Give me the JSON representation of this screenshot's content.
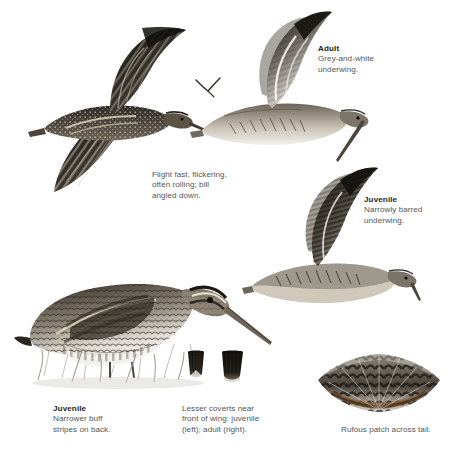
{
  "plate": {
    "background": "#ffffff",
    "ink": "#1d1f22",
    "caption_color": "#53565b",
    "width": 459,
    "height": 454
  },
  "figures": [
    {
      "name": "snipe-flight-upperside",
      "role": "Snipe in flight seen from above, wings raised in a V, dark brown back with buff braces, bill angled down",
      "position": {
        "x": 22,
        "y": 22,
        "w": 185,
        "h": 190
      }
    },
    {
      "name": "snipe-flight-adult-underwing",
      "role": "Adult snipe in flight seen from below showing grey-and-white underwing",
      "position": {
        "x": 196,
        "y": 18,
        "w": 170,
        "h": 145
      }
    },
    {
      "name": "snipe-distant-silhouette",
      "role": "Tiny distant snipe silhouette in flight",
      "position": {
        "x": 196,
        "y": 78,
        "w": 26,
        "h": 20
      }
    },
    {
      "name": "snipe-flight-juvenile-underwing",
      "role": "Juvenile snipe in flight showing narrowly barred underwing",
      "position": {
        "x": 252,
        "y": 178,
        "w": 160,
        "h": 130
      }
    },
    {
      "name": "snipe-standing-juvenile",
      "role": "Juvenile snipe standing in grass, striped crown, long bill angled down",
      "position": {
        "x": 20,
        "y": 252,
        "w": 255,
        "h": 145
      }
    },
    {
      "name": "lesser-covert-juvenile",
      "role": "Juvenile lesser covert feather detail with pale fringe",
      "position": {
        "x": 188,
        "y": 352,
        "w": 24,
        "h": 34
      }
    },
    {
      "name": "lesser-covert-adult",
      "role": "Adult lesser covert feather detail, plain dark",
      "position": {
        "x": 222,
        "y": 352,
        "w": 26,
        "h": 34
      }
    },
    {
      "name": "tail-fan",
      "role": "Spread tail fan showing rufous band across the tail",
      "position": {
        "x": 318,
        "y": 342,
        "w": 125,
        "h": 72
      }
    }
  ],
  "captions": [
    {
      "name": "caption-adult-underwing",
      "heading": "Adult",
      "body": "Grey-and-white\nunderwing.",
      "x": 318,
      "y": 48
    },
    {
      "name": "caption-flight-action",
      "heading": "",
      "body": "Flight fast, flickering,\noften rolling; bill\nangled down.",
      "x": 152,
      "y": 172
    },
    {
      "name": "caption-juvenile-underwing",
      "heading": "Juvenile",
      "body": "Narrowly barred\nunderwing.",
      "x": 364,
      "y": 198
    },
    {
      "name": "caption-juvenile-standing",
      "heading": "Juvenile",
      "body": "Narrower buff\nstripes on back.",
      "x": 53,
      "y": 406
    },
    {
      "name": "caption-lesser-coverts",
      "heading": "",
      "body": "Lesser coverts near\nfront of wing: juvenile\n(left); adult (right).",
      "x": 182,
      "y": 406
    },
    {
      "name": "caption-tail-patch",
      "heading": "",
      "body": "Rufous patch across tail.",
      "x": 341,
      "y": 427
    }
  ]
}
